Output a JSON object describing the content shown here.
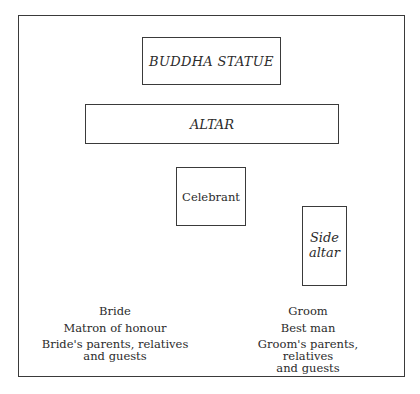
{
  "diagram": {
    "type": "seating-layout",
    "elements": {
      "buddha_statue": "BUDDHA STATUE",
      "altar": "ALTAR",
      "celebrant": "Celebrant",
      "side_altar": [
        "Side",
        "altar"
      ]
    },
    "bride_side": {
      "line1": "Bride",
      "line2": "Matron of honour",
      "line3a": "Bride's parents, relatives",
      "line3b": "and guests"
    },
    "groom_side": {
      "line1": "Groom",
      "line2": "Best man",
      "line3a": "Groom's parents, relatives",
      "line3b": "and guests"
    }
  }
}
